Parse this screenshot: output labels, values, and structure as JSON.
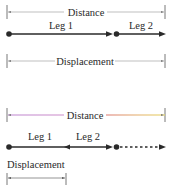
{
  "diagram_top": {
    "distance_label": "Distance",
    "leg1_label": "Leg 1",
    "leg2_label": "Leg 2",
    "displacement_label": "Displacement"
  },
  "diagram_bottom": {
    "distance_label": "Distance",
    "leg1_label": "Leg 1",
    "leg2_label": "Leg 2",
    "displacement_label": "Displacement"
  },
  "colors": {
    "line_dark": "#2a2a2a",
    "dimension_line": "#b0b0b0",
    "gradient_start": "#c89ad8",
    "gradient_mid": "#e08080",
    "gradient_end": "#e8d870"
  }
}
